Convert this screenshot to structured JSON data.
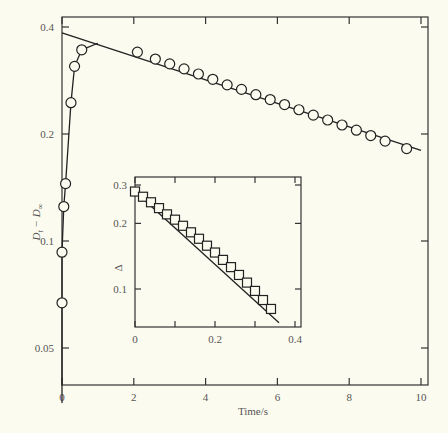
{
  "chart_data": [
    {
      "type": "scatter",
      "title": "",
      "xlabel": "Time/s",
      "ylabel": "D_t − D_∞",
      "yscale": "log",
      "xlim": [
        0,
        10.2
      ],
      "ylim": [
        0.035,
        0.42
      ],
      "xticks": [
        0,
        2,
        4,
        6,
        8,
        10
      ],
      "xtick_labels": [
        "0",
        "2",
        "4",
        "6",
        "8",
        "10"
      ],
      "yticks": [
        0.05,
        0.1,
        0.2,
        0.4
      ],
      "ytick_labels": [
        "0.05",
        "0.1",
        "0.2",
        "0.4"
      ],
      "grid": false,
      "legend": null,
      "series": [
        {
          "name": "rise (early times)",
          "marker": "circle",
          "x": [
            0.0,
            0.0,
            0.05,
            0.1,
            0.25,
            0.35,
            0.55
          ],
          "y": [
            0.067,
            0.093,
            0.125,
            0.145,
            0.245,
            0.31,
            0.345
          ]
        },
        {
          "name": "decay (later times)",
          "marker": "circle",
          "x": [
            2.1,
            2.6,
            3.0,
            3.4,
            3.8,
            4.2,
            4.6,
            5.0,
            5.4,
            5.8,
            6.2,
            6.6,
            7.0,
            7.4,
            7.8,
            8.2,
            8.6,
            9.0,
            9.6
          ],
          "y": [
            0.34,
            0.325,
            0.315,
            0.305,
            0.295,
            0.285,
            0.275,
            0.267,
            0.258,
            0.25,
            0.242,
            0.234,
            0.226,
            0.219,
            0.212,
            0.205,
            0.198,
            0.191,
            0.182
          ]
        }
      ],
      "fit_lines": [
        {
          "name": "linear decay fit",
          "x": [
            0,
            10.0
          ],
          "y": [
            0.385,
            0.18
          ]
        },
        {
          "name": "rise curve",
          "x": [
            0.0,
            0.0,
            0.05,
            0.1,
            0.25,
            0.35,
            0.55,
            1.0
          ],
          "y": [
            0.035,
            0.093,
            0.125,
            0.145,
            0.245,
            0.31,
            0.345,
            0.36
          ]
        }
      ]
    },
    {
      "type": "scatter",
      "title": "inset",
      "xlabel": "",
      "ylabel": "Δ",
      "yscale": "log",
      "xlim": [
        0,
        0.4
      ],
      "ylim": [
        0.06,
        0.3
      ],
      "xticks": [
        0,
        0.1,
        0.2,
        0.3,
        0.4
      ],
      "xtick_labels": [
        "0",
        "",
        "0.2",
        "",
        "0.4"
      ],
      "yticks": [
        0.1,
        0.2,
        0.3
      ],
      "ytick_labels": [
        "0.1",
        "0.2",
        "0.3"
      ],
      "grid": false,
      "legend": null,
      "series": [
        {
          "name": "Δ",
          "marker": "square",
          "x": [
            0.0,
            0.02,
            0.04,
            0.06,
            0.08,
            0.1,
            0.12,
            0.14,
            0.16,
            0.18,
            0.2,
            0.22,
            0.24,
            0.26,
            0.28,
            0.3,
            0.32,
            0.34
          ],
          "y": [
            0.28,
            0.265,
            0.25,
            0.235,
            0.22,
            0.208,
            0.195,
            0.182,
            0.17,
            0.158,
            0.147,
            0.136,
            0.126,
            0.116,
            0.107,
            0.098,
            0.089,
            0.081
          ]
        }
      ],
      "fit_lines": [
        {
          "name": "inset fit",
          "x": [
            0.0,
            0.36
          ],
          "y": [
            0.28,
            0.07
          ]
        }
      ]
    }
  ],
  "labels": {
    "xlabel": "Time/s",
    "ylabel_main": "D",
    "ylabel_sub_t": "t",
    "ylabel_dash": " − D",
    "ylabel_sub_inf": "∞",
    "inset_ylabel": "Δ",
    "main_xticks": [
      "0",
      "2",
      "4",
      "6",
      "8",
      "10"
    ],
    "main_yticks": [
      "0.4",
      "0.2",
      "0.1",
      "0.05"
    ],
    "inset_xticks": [
      "0",
      "0.2",
      "0.4"
    ],
    "inset_yticks": [
      "0.3",
      "0.2",
      "0.1"
    ]
  }
}
